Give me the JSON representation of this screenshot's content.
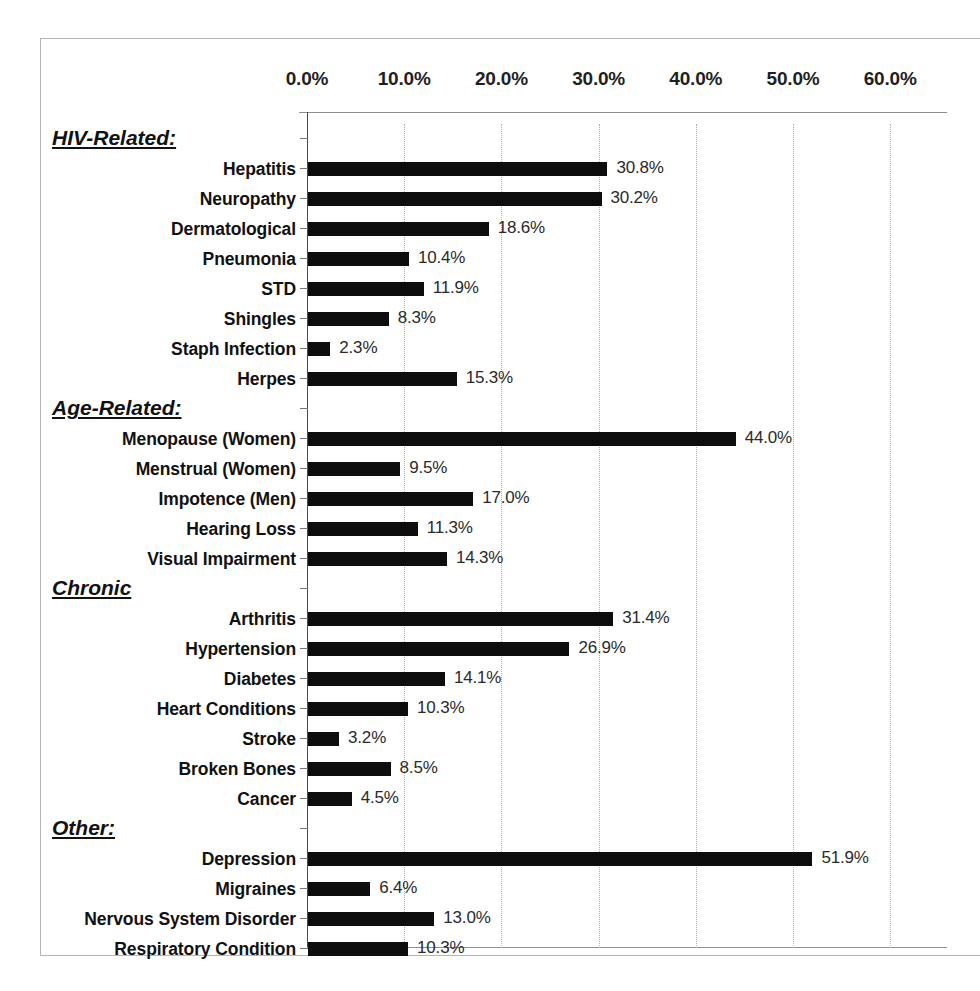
{
  "chart_data": {
    "type": "bar",
    "orientation": "horizontal",
    "title": "",
    "xlabel": "",
    "ylabel": "",
    "xlim": [
      0,
      60
    ],
    "xticks": [
      0,
      10,
      20,
      30,
      40,
      50,
      60
    ],
    "xtick_labels": [
      "0.0%",
      "10.0%",
      "20.0%",
      "30.0%",
      "40.0%",
      "50.0%",
      "60.0%"
    ],
    "grid": true,
    "legend": "none",
    "value_label_suffix": "%",
    "bar_color": "#0d0d0d",
    "gridline_color": "#b0b0b0",
    "groups": [
      {
        "heading": "HIV-Related:",
        "categories": [
          "Hepatitis",
          "Neuropathy",
          "Dermatological",
          "Pneumonia",
          "STD",
          "Shingles",
          "Staph Infection",
          "Herpes"
        ],
        "values": [
          30.8,
          30.2,
          18.6,
          10.4,
          11.9,
          8.3,
          2.3,
          15.3
        ],
        "value_labels": [
          "30.8%",
          "30.2%",
          "18.6%",
          "10.4%",
          "11.9%",
          "8.3%",
          "2.3%",
          "15.3%"
        ]
      },
      {
        "heading": "Age-Related:",
        "categories": [
          "Menopause (Women)",
          "Menstrual (Women)",
          "Impotence (Men)",
          "Hearing Loss",
          "Visual Impairment"
        ],
        "values": [
          44.0,
          9.5,
          17.0,
          11.3,
          14.3
        ],
        "value_labels": [
          "44.0%",
          "9.5%",
          "17.0%",
          "11.3%",
          "14.3%"
        ]
      },
      {
        "heading": "Chronic",
        "categories": [
          "Arthritis",
          "Hypertension",
          "Diabetes",
          "Heart Conditions",
          "Stroke",
          "Broken Bones",
          "Cancer"
        ],
        "values": [
          31.4,
          26.9,
          14.1,
          10.3,
          3.2,
          8.5,
          4.5
        ],
        "value_labels": [
          "31.4%",
          "26.9%",
          "14.1%",
          "10.3%",
          "3.2%",
          "8.5%",
          "4.5%"
        ]
      },
      {
        "heading": "Other:",
        "categories": [
          "Depression",
          "Migraines",
          "Nervous System Disorder",
          "Respiratory Condition"
        ],
        "values": [
          51.9,
          6.4,
          13.0,
          10.3
        ],
        "value_labels": [
          "51.9%",
          "6.4%",
          "13.0%",
          "10.3%"
        ]
      }
    ]
  }
}
